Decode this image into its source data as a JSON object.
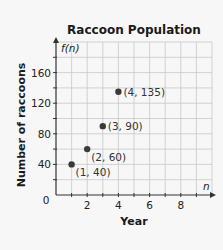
{
  "chart_data": {
    "type": "scatter",
    "title": "Raccoon Population",
    "xlabel": "Year",
    "ylabel": "Number of raccoons",
    "x_axis_var": "n",
    "y_axis_var": "f(n)",
    "origin_label": "0",
    "xlim": [
      0,
      10
    ],
    "ylim": [
      0,
      200
    ],
    "x_ticks": [
      2,
      4,
      6,
      8
    ],
    "y_ticks": [
      40,
      80,
      120,
      160
    ],
    "x_minor_step": 1,
    "y_minor_step": 20,
    "grid": true,
    "points": [
      {
        "x": 1,
        "y": 40,
        "label": "(1, 40)"
      },
      {
        "x": 2,
        "y": 60,
        "label": "(2, 60)"
      },
      {
        "x": 3,
        "y": 90,
        "label": "(3, 90)"
      },
      {
        "x": 4,
        "y": 135,
        "label": "(4, 135)"
      }
    ],
    "colors": {
      "grid": "#c8c8c8",
      "axis": "#333333",
      "point": "#3a3a3a"
    }
  }
}
